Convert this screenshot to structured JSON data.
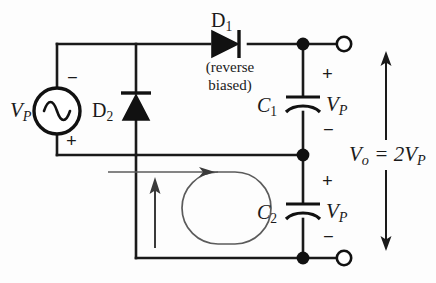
{
  "figure": {
    "type": "schematic-diagram",
    "colors": {
      "wire": "#1a1a1a",
      "loop": "#555555",
      "background": "#ffffff",
      "node_fill": "#111111",
      "terminal_fill": "#ffffff"
    }
  },
  "labels": {
    "source": "V",
    "source_sub": "P",
    "source_minus": "−",
    "source_plus": "+",
    "diode1": "D",
    "diode1_sub": "1",
    "diode1_note_line1": "(reverse",
    "diode1_note_line2": "biased)",
    "diode2": "D",
    "diode2_sub": "2",
    "cap1": "C",
    "cap1_sub": "1",
    "cap1_voltage": "V",
    "cap1_voltage_sub": "P",
    "cap1_plus": "+",
    "cap1_minus": "−",
    "cap2": "C",
    "cap2_sub": "2",
    "cap2_voltage": "V",
    "cap2_voltage_sub": "P",
    "cap2_plus": "+",
    "cap2_minus": "−",
    "output": "V",
    "output_sub": "o",
    "output_expr": " = 2V",
    "output_expr_sub": "P"
  },
  "elements": {
    "ac_source": "ac-voltage-source",
    "diode_1": "diode-reverse-biased",
    "diode_2": "diode-forward-biased",
    "capacitor_1": "capacitor",
    "capacitor_2": "capacitor",
    "output_terminal_top": "open-terminal",
    "output_terminal_bottom": "open-terminal",
    "current_loop": "current-flow-loop-arrow",
    "current_arrow_d2": "current-arrow-through-d2",
    "output_arrow": "output-voltage-double-arrow"
  }
}
